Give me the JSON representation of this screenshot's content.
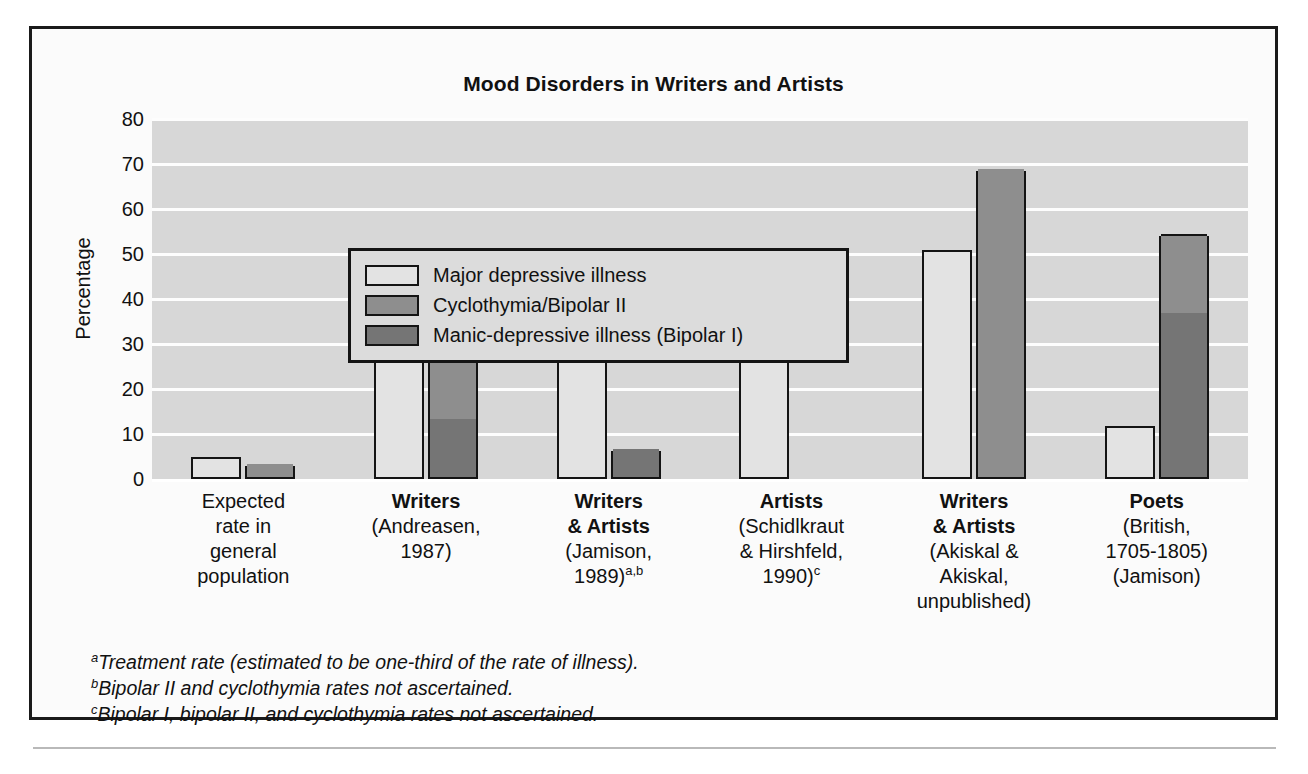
{
  "chart_data": {
    "type": "bar",
    "title": "Mood Disorders in Writers and Artists",
    "xlabel": "",
    "ylabel": "Percentage",
    "ylim": [
      0,
      80
    ],
    "ytick_step": 10,
    "yticks": [
      80,
      70,
      60,
      50,
      40,
      30,
      20,
      10,
      0
    ],
    "grid": "horizontal-white-gridlines",
    "legend_position": "inside-top-left",
    "stacked": true,
    "series": [
      {
        "name": "Major depressive illness",
        "color": "#e3e3e3",
        "values": [
          5.0,
          36.0,
          31.5,
          39.7,
          51.0,
          11.8
        ]
      },
      {
        "name": "Cyclothymia/Bipolar II",
        "color": "#8e8e8e",
        "values": [
          2.8,
          29.8,
          0,
          0,
          68.5,
          17.5
        ]
      },
      {
        "name": "Manic-depressive illness (Bipolar I)",
        "color": "#757575",
        "values": [
          0,
          13.0,
          6.2,
          0,
          0,
          36.5
        ]
      }
    ],
    "bar_group_totals": {
      "second_bar_totals": [
        2.8,
        42.8,
        6.2,
        0,
        68.5,
        54.0
      ]
    },
    "categories": [
      {
        "lines": [
          {
            "text": "Expected",
            "bold": false
          },
          {
            "text": "rate in",
            "bold": false
          },
          {
            "text": "general",
            "bold": false
          },
          {
            "text": "population",
            "bold": false
          }
        ]
      },
      {
        "lines": [
          {
            "text": "Writers",
            "bold": true
          },
          {
            "text": "(Andreasen,",
            "bold": false
          },
          {
            "text": "1987)",
            "bold": false
          }
        ]
      },
      {
        "lines": [
          {
            "text": "Writers",
            "bold": true
          },
          {
            "text": "& Artists",
            "bold": true
          },
          {
            "text": "(Jamison,",
            "bold": false
          },
          {
            "text": "1989)",
            "bold": false,
            "sup": "a,b"
          }
        ]
      },
      {
        "lines": [
          {
            "text": "Artists",
            "bold": true
          },
          {
            "text": "(Schidlkraut",
            "bold": false
          },
          {
            "text": "& Hirshfeld,",
            "bold": false
          },
          {
            "text": "1990)",
            "bold": false,
            "sup": "c"
          }
        ]
      },
      {
        "lines": [
          {
            "text": "Writers",
            "bold": true
          },
          {
            "text": "& Artists",
            "bold": true
          },
          {
            "text": "(Akiskal &",
            "bold": false
          },
          {
            "text": "Akiskal,",
            "bold": false
          },
          {
            "text": "unpublished)",
            "bold": false
          }
        ]
      },
      {
        "lines": [
          {
            "text": "Poets",
            "bold": true
          },
          {
            "text": "(British,",
            "bold": false
          },
          {
            "text": "1705-1805)",
            "bold": false
          },
          {
            "text": "(Jamison)",
            "bold": false
          }
        ]
      }
    ]
  },
  "legend": {
    "items": [
      {
        "label": "Major depressive illness",
        "color": "#e3e3e3"
      },
      {
        "label": "Cyclothymia/Bipolar II",
        "color": "#8e8e8e"
      },
      {
        "label": "Manic-depressive illness (Bipolar I)",
        "color": "#757575"
      }
    ]
  },
  "footnotes": [
    {
      "marker": "a",
      "text": "Treatment rate (estimated to be one-third of the rate of illness)."
    },
    {
      "marker": "b",
      "text": "Bipolar II and cyclothymia rates not ascertained."
    },
    {
      "marker": "c",
      "text": "Bipolar I, bipolar II, and cyclothymia rates not ascertained."
    }
  ]
}
